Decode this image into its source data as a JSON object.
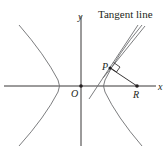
{
  "diagram": {
    "type": "hyperbola-tangent-normal",
    "labels": {
      "tangent": "Tangent line",
      "x_axis": "x",
      "y_axis": "y",
      "origin": "O",
      "point_p": "P",
      "point_r": "R"
    },
    "colors": {
      "axes": "#231f20",
      "curve": "#6d6e71",
      "lines": "#6d6e71",
      "text": "#231f20"
    }
  }
}
